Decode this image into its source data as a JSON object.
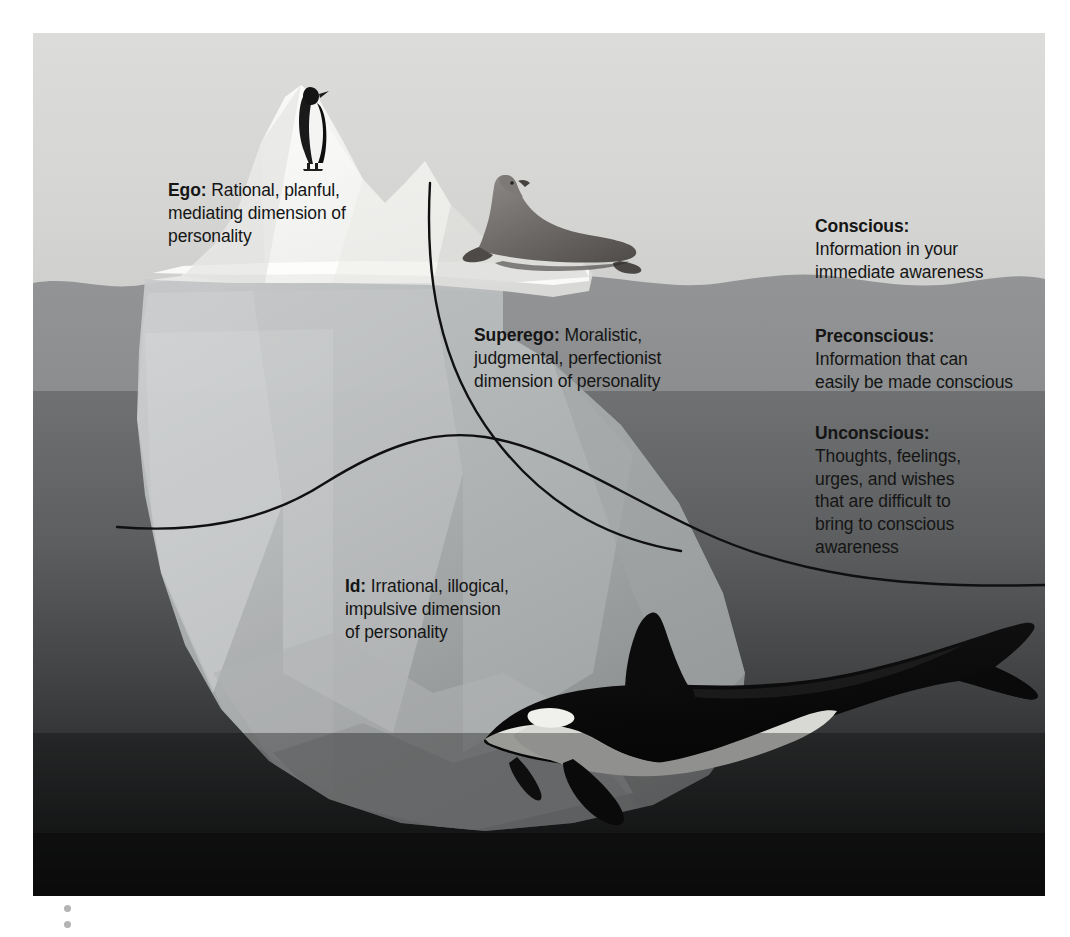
{
  "figure": {
    "alt": "Iceberg diagram illustrating Freud's structural and topographic models of personality",
    "canvas": {
      "x": 33,
      "y": 33,
      "width": 1012,
      "height": 863
    }
  },
  "structure_labels": [
    {
      "id": "ego",
      "term": "Ego:",
      "definition": " Rational, planful,\nmediating dimension of\npersonality"
    },
    {
      "id": "superego",
      "term": "Superego:",
      "definition": " Moralistic,\njudgmental, perfectionist\ndimension of personality"
    },
    {
      "id": "id",
      "term": "Id:",
      "definition": " Irrational, illogical,\nimpulsive dimension\nof personality"
    }
  ],
  "awareness_levels": [
    {
      "id": "conscious",
      "term": "Conscious:",
      "definition": "Information in your\nimmediate awareness",
      "band_color": "#e8e8e6"
    },
    {
      "id": "preconscious",
      "term": "Preconscious:",
      "definition": "Information that can\neasily be made conscious",
      "band_color": "#8e9091"
    },
    {
      "id": "unconscious",
      "term": "Unconscious:",
      "definition": "Thoughts, feelings,\nurges, and wishes\nthat are difficult to\nbring to conscious\nawareness",
      "band_color": "#6e7071"
    }
  ],
  "animals": [
    {
      "id": "penguin",
      "name": "penguin",
      "position": "iceberg summit"
    },
    {
      "id": "seal",
      "name": "seal",
      "position": "iceberg ledge above water"
    },
    {
      "id": "orca",
      "name": "orca whale",
      "position": "deep water, lower right"
    }
  ],
  "colors": {
    "sky": "#dedede",
    "water_surface": "#8e9091",
    "water_deep": "#121212",
    "iceberg_light": "#f2f2f0",
    "iceberg_submerged": "#b9bcbd",
    "divider_line": "#101010",
    "text": "#151515",
    "bullet_dot": "#b4b4b4"
  },
  "decorations": {
    "bullet_dots": 2
  }
}
